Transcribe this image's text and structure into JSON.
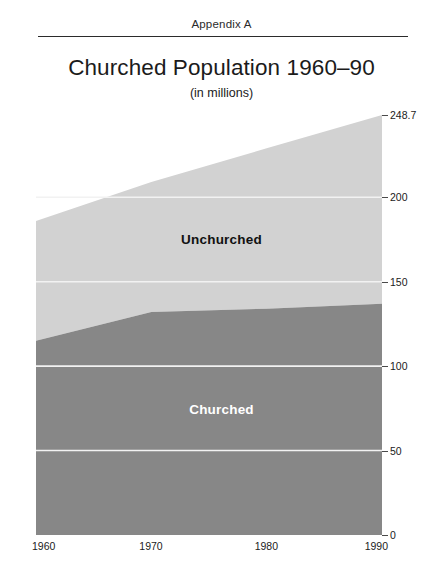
{
  "header": {
    "running_head": "Appendix A"
  },
  "titles": {
    "main": "Churched Population 1960–90",
    "sub": "(in millions)"
  },
  "colors": {
    "unchurched_area": "#d2d2d2",
    "churched_area": "#878787",
    "gridline": "#f2f2f2",
    "axis": "#4a4a4a",
    "text": "#1b1b1b"
  },
  "labels": {
    "unchurched": "Unchurched",
    "churched": "Churched"
  },
  "chart_data": {
    "type": "area",
    "title": "Churched Population 1960–90",
    "subtitle": "(in millions)",
    "xlabel": "",
    "ylabel": "",
    "stacked": true,
    "grid": true,
    "legend": "inline-area-labels",
    "x": [
      1960,
      1970,
      1980,
      1990
    ],
    "categories": [
      "1960",
      "1970",
      "1980",
      "1990"
    ],
    "xlim": [
      1960,
      1990
    ],
    "ylim": [
      0,
      248.7
    ],
    "yticks": [
      0,
      50,
      100,
      150,
      200,
      248.7
    ],
    "ytick_labels": [
      "0",
      "50",
      "100",
      "150",
      "200",
      "248.7"
    ],
    "xtick_labels": [
      "1960",
      "1970",
      "1980",
      "1990"
    ],
    "series": [
      {
        "name": "Churched",
        "values": [
          115,
          132,
          134,
          137
        ]
      },
      {
        "name": "Unchurched",
        "values": [
          71,
          77,
          95,
          111.7
        ]
      }
    ],
    "totals": [
      186,
      209,
      229,
      248.7
    ]
  }
}
